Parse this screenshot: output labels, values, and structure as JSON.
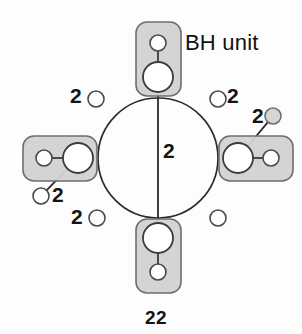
{
  "figure": {
    "caption": "22",
    "annotation_label": "BH unit",
    "colors": {
      "background": "#fdfdfd",
      "unit_fill": "#d2d2d2",
      "unit_stroke": "#6e6e6e",
      "node_fill": "#ffffff",
      "node_stroke": "#3b3b3b",
      "bond_stroke": "#2b2b2b",
      "text": "#141414"
    },
    "units": [
      {
        "name": "top-bh-unit",
        "position": "top",
        "orientation": "vertical",
        "hub": {
          "cx": 158,
          "cy": 77,
          "r": 15
        },
        "pendant": {
          "cx": 158,
          "cy": 43,
          "r": 8
        },
        "box": {
          "x": 136,
          "y": 22,
          "w": 45,
          "h": 74,
          "rx": 11
        }
      },
      {
        "name": "left-bh-unit",
        "position": "left",
        "orientation": "horizontal",
        "hub": {
          "cx": 78,
          "cy": 158,
          "r": 15
        },
        "pendant": {
          "cx": 44,
          "cy": 158,
          "r": 8
        },
        "box": {
          "x": 23,
          "y": 136,
          "w": 74,
          "h": 45,
          "rx": 11
        }
      },
      {
        "name": "right-bh-unit",
        "position": "right",
        "orientation": "horizontal",
        "hub": {
          "cx": 238,
          "cy": 158,
          "r": 15
        },
        "pendant": {
          "cx": 271,
          "cy": 158,
          "r": 8
        },
        "box": {
          "x": 219,
          "y": 136,
          "w": 74,
          "h": 45,
          "rx": 11
        }
      },
      {
        "name": "bottom-bh-unit",
        "position": "bottom",
        "orientation": "vertical",
        "hub": {
          "cx": 158,
          "cy": 238,
          "r": 15
        },
        "pendant": {
          "cx": 158,
          "cy": 272,
          "r": 8
        },
        "box": {
          "x": 136,
          "y": 219,
          "w": 45,
          "h": 74,
          "rx": 11
        }
      }
    ],
    "ring": {
      "cx": 158,
      "cy": 158,
      "r": 60
    },
    "ring_nodes": [
      {
        "name": "ring-node-top-left",
        "cx": 96,
        "cy": 99,
        "r": 8,
        "label": "2",
        "label_x": 70,
        "label_y": 85
      },
      {
        "name": "ring-node-top-right",
        "cx": 218,
        "cy": 99,
        "r": 8,
        "label": "2",
        "label_x": 227,
        "label_y": 85
      },
      {
        "name": "ring-node-bottom-left",
        "cx": 97,
        "cy": 218,
        "r": 8,
        "label": "2",
        "label_x": 71,
        "label_y": 206
      },
      {
        "name": "ring-node-bottom-right",
        "cx": 218,
        "cy": 218,
        "r": 8,
        "label": "",
        "label_x": 0,
        "label_y": 0
      }
    ],
    "pendant_nodes": [
      {
        "name": "pendant-node-left-lower",
        "cx": 41,
        "cy": 196,
        "r": 8,
        "from_cx": 78,
        "from_cy": 158,
        "label": "2",
        "label_x": 52,
        "label_y": 184
      },
      {
        "name": "pendant-node-right-upper",
        "cx": 273,
        "cy": 116,
        "r": 8,
        "from_cx": 238,
        "from_cy": 158,
        "label": "2",
        "label_x": 252,
        "label_y": 105
      }
    ],
    "center_chord": {
      "name": "center-chord-bond",
      "x1": 158,
      "y1": 92,
      "x2": 158,
      "y2": 223,
      "label": "2",
      "label_x": 163,
      "label_y": 140
    },
    "annotation_pos": {
      "x": 185,
      "y": 32
    },
    "caption_pos": {
      "x": 136,
      "y": 308
    }
  }
}
